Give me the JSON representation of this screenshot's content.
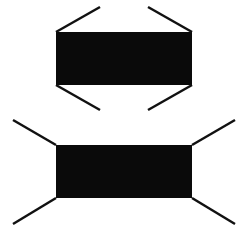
{
  "figures": [
    {
      "name": "figure-top",
      "description": "rectangle with inward-pointing corner lines (arrowhead-like converging fins)",
      "rect": {
        "x": 56,
        "y": 32,
        "width": 136,
        "height": 53
      },
      "lines": [
        {
          "x1": 56,
          "y1": 32,
          "x2": 100,
          "y2": 7
        },
        {
          "x1": 192,
          "y1": 32,
          "x2": 148,
          "y2": 7
        },
        {
          "x1": 56,
          "y1": 85,
          "x2": 100,
          "y2": 110
        },
        {
          "x1": 192,
          "y1": 85,
          "x2": 148,
          "y2": 110
        }
      ]
    },
    {
      "name": "figure-bottom",
      "description": "rectangle with outward-pointing corner lines (diverging fins)",
      "rect": {
        "x": 56,
        "y": 145,
        "width": 136,
        "height": 53
      },
      "lines": [
        {
          "x1": 56,
          "y1": 145,
          "x2": 13,
          "y2": 120
        },
        {
          "x1": 192,
          "y1": 145,
          "x2": 235,
          "y2": 120
        },
        {
          "x1": 56,
          "y1": 198,
          "x2": 13,
          "y2": 224
        },
        {
          "x1": 192,
          "y1": 198,
          "x2": 235,
          "y2": 224
        }
      ]
    }
  ],
  "colors": {
    "fill": "#0a0a0a",
    "stroke": "#111111",
    "background": "#ffffff"
  }
}
